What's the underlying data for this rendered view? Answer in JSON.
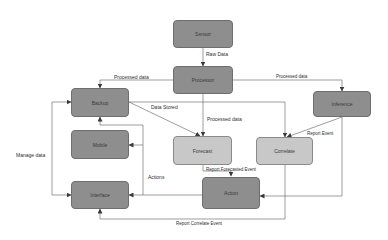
{
  "nodes": {
    "sensor": "Sensor",
    "processor": "Processor",
    "backup": "Backup",
    "inference": "Inference",
    "mobile": "Mobile",
    "forecast": "Forecast",
    "correlate": "Correlate",
    "interface": "Interface",
    "action": "Action"
  },
  "edges": {
    "raw_data": "Raw Data",
    "processed_data_left": "Processed data",
    "processed_data_right": "Processed data",
    "processed_data_center": "Processed data",
    "data_stored": "Data Stored",
    "report_event": "Report Event",
    "report_forecasted_event": "Report Forecasted Event",
    "actions": "Actions",
    "manage_data": "Manage data",
    "report_correlate_event": "Report Correlate Event"
  },
  "colors": {
    "dark_node": "#8e8e8e",
    "light_node": "#c8c8c8",
    "line": "#5a5a5a"
  }
}
